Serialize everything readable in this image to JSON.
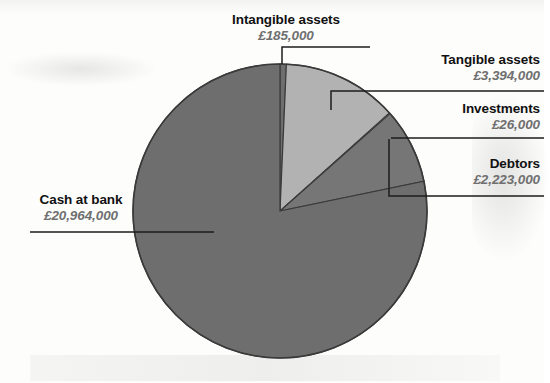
{
  "chart_data": {
    "type": "pie",
    "title": "",
    "currency_symbol": "£",
    "units": "GBP",
    "total": 26792000,
    "categories": [
      "Intangible assets",
      "Tangible assets",
      "Investments",
      "Debtors",
      "Cash at bank"
    ],
    "values": [
      185000,
      3394000,
      26000,
      2223000,
      20964000
    ],
    "value_labels": [
      "£185,000",
      "£3,394,000",
      "£26,000",
      "£2,223,000",
      "£20,964,000"
    ],
    "slices": [
      {
        "name": "Intangible assets",
        "value": 185000,
        "value_label": "£185,000",
        "percent": 0.69,
        "color": "#6e6e6e",
        "start_angle_deg": 0.0,
        "end_angle_deg": 2.49
      },
      {
        "name": "Tangible assets",
        "value": 3394000,
        "value_label": "£3,394,000",
        "percent": 12.67,
        "color": "#b2b2b2",
        "start_angle_deg": 2.49,
        "end_angle_deg": 48.1
      },
      {
        "name": "Investments",
        "value": 26000,
        "value_label": "£26,000",
        "percent": 0.1,
        "color": "#9a9a9a",
        "start_angle_deg": 48.1,
        "end_angle_deg": 48.45
      },
      {
        "name": "Debtors",
        "value": 2223000,
        "value_label": "£2,223,000",
        "percent": 8.3,
        "color": "#767676",
        "start_angle_deg": 48.45,
        "end_angle_deg": 78.33
      },
      {
        "name": "Cash at bank",
        "value": 20964000,
        "value_label": "£20,964,000",
        "percent": 78.25,
        "color": "#6e6e6e",
        "start_angle_deg": 78.33,
        "end_angle_deg": 360.0
      }
    ],
    "legend": "callout-labels",
    "grid": false,
    "xlabel": "",
    "ylabel": ""
  },
  "labels": {
    "intangible": {
      "name": "Intangible assets",
      "value": "£185,000"
    },
    "tangible": {
      "name": "Tangible assets",
      "value": "£3,394,000"
    },
    "investments": {
      "name": "Investments",
      "value": "£26,000"
    },
    "debtors": {
      "name": "Debtors",
      "value": "£2,223,000"
    },
    "cash": {
      "name": "Cash at bank",
      "value": "£20,964,000"
    }
  },
  "colors": {
    "background": "#fdfdfc",
    "slice_dark": "#6e6e6e",
    "slice_mid": "#767676",
    "slice_light": "#b2b2b2",
    "slice_sliver": "#9a9a9a",
    "outline": "#3a3a3a",
    "leader_line": "#1d1d1d",
    "label_name": "#111111",
    "label_value": "#6f6f6f"
  },
  "geometry": {
    "center_x": 280,
    "center_y": 211,
    "radius": 147
  }
}
